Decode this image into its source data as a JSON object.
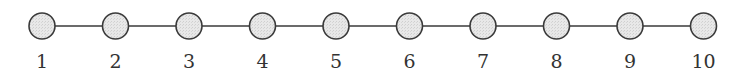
{
  "diagram": {
    "type": "path-graph",
    "node_fill": "#e6e6e6",
    "node_stroke": "#3a3a3a",
    "edge_color": "#3a3a3a",
    "nodes": [
      {
        "label": "1",
        "cx": 42
      },
      {
        "label": "2",
        "cx": 115.5
      },
      {
        "label": "3",
        "cx": 189
      },
      {
        "label": "4",
        "cx": 262.5
      },
      {
        "label": "5",
        "cx": 336
      },
      {
        "label": "6",
        "cx": 409.5
      },
      {
        "label": "7",
        "cx": 483
      },
      {
        "label": "8",
        "cx": 556.5
      },
      {
        "label": "9",
        "cx": 630
      },
      {
        "label": "10",
        "cx": 703.5
      }
    ],
    "edges": [
      [
        1,
        2
      ],
      [
        2,
        3
      ],
      [
        3,
        4
      ],
      [
        4,
        5
      ],
      [
        5,
        6
      ],
      [
        6,
        7
      ],
      [
        7,
        8
      ],
      [
        8,
        9
      ],
      [
        9,
        10
      ]
    ]
  }
}
